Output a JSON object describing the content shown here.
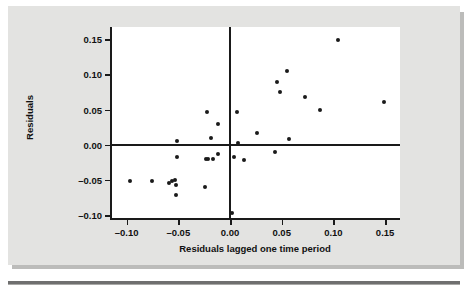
{
  "figure": {
    "background_color": "#e3e3e1",
    "plot_background_color": "#ffffff",
    "axis_color": "#1a1a1a",
    "point_color": "#1a1a1a"
  },
  "chart_data": {
    "type": "scatter",
    "title": "",
    "xlabel": "Residuals lagged one time period",
    "ylabel": "Residuals",
    "xlim": [
      -0.125,
      0.166
    ],
    "ylim": [
      -0.111,
      0.1665
    ],
    "xticks": [
      -0.1,
      -0.05,
      0.0,
      0.05,
      0.1,
      0.15
    ],
    "xticklabels": [
      "–0.10",
      "–0.05",
      "0.00",
      "0.05",
      "0.10",
      "0.15"
    ],
    "yticks": [
      0.15,
      0.1,
      0.05,
      0.0,
      -0.05,
      -0.1
    ],
    "yticklabels": [
      "0.15",
      "0.10",
      "0.05",
      "0.00",
      "–0.05",
      "–0.10"
    ],
    "grid": false,
    "legend": false,
    "reference_lines": [
      {
        "orientation": "horizontal",
        "value": 0.0
      },
      {
        "orientation": "vertical",
        "value": 0.0
      }
    ],
    "series": [
      {
        "name": "Residuals vs lagged residuals",
        "marker": "circle",
        "points": [
          {
            "x": -0.097,
            "y": -0.052
          },
          {
            "x": -0.075,
            "y": -0.052
          },
          {
            "x": -0.059,
            "y": -0.054
          },
          {
            "x": -0.056,
            "y": -0.052
          },
          {
            "x": -0.053,
            "y": -0.05
          },
          {
            "x": -0.052,
            "y": -0.057
          },
          {
            "x": -0.052,
            "y": -0.072
          },
          {
            "x": -0.051,
            "y": 0.005
          },
          {
            "x": -0.051,
            "y": -0.017
          },
          {
            "x": -0.024,
            "y": -0.06
          },
          {
            "x": -0.023,
            "y": -0.021
          },
          {
            "x": -0.021,
            "y": -0.021
          },
          {
            "x": -0.022,
            "y": 0.047
          },
          {
            "x": -0.018,
            "y": 0.01
          },
          {
            "x": -0.016,
            "y": -0.02
          },
          {
            "x": -0.012,
            "y": 0.029
          },
          {
            "x": -0.012,
            "y": -0.013
          },
          {
            "x": 0.002,
            "y": -0.097
          },
          {
            "x": 0.004,
            "y": -0.018
          },
          {
            "x": 0.007,
            "y": 0.047
          },
          {
            "x": 0.008,
            "y": 0.003
          },
          {
            "x": 0.014,
            "y": -0.022
          },
          {
            "x": 0.026,
            "y": 0.017
          },
          {
            "x": 0.045,
            "y": 0.089
          },
          {
            "x": 0.044,
            "y": -0.01
          },
          {
            "x": 0.048,
            "y": 0.075
          },
          {
            "x": 0.055,
            "y": 0.105
          },
          {
            "x": 0.057,
            "y": 0.008
          },
          {
            "x": 0.073,
            "y": 0.068
          },
          {
            "x": 0.087,
            "y": 0.05
          },
          {
            "x": 0.104,
            "y": 0.149
          },
          {
            "x": 0.149,
            "y": 0.061
          }
        ]
      }
    ]
  }
}
